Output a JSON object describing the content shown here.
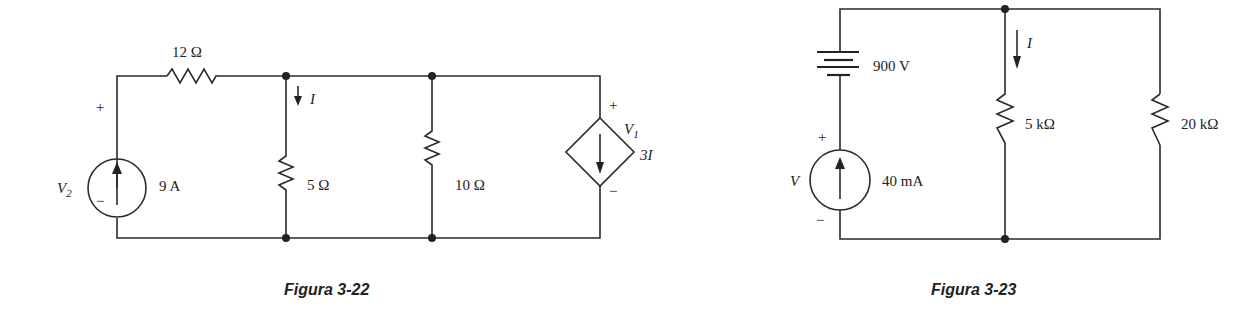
{
  "figures": [
    {
      "caption": "Figura 3-22",
      "components": {
        "r_series": {
          "label": "12 Ω"
        },
        "current_source": {
          "value": "9 A",
          "voltage_label": "V",
          "voltage_sub": "2",
          "plus": "+",
          "minus": "−"
        },
        "r_branch1": {
          "label": "5 Ω",
          "current_label": "I"
        },
        "r_branch2": {
          "label": "10 Ω"
        },
        "dependent_source": {
          "value": "3I",
          "voltage_label": "V",
          "voltage_sub": "1",
          "plus": "+",
          "minus": "−"
        }
      }
    },
    {
      "caption": "Figura 3-23",
      "components": {
        "battery": {
          "label": "900 V"
        },
        "current_source": {
          "value": "40 mA",
          "voltage_label": "V",
          "plus": "+",
          "minus": "−"
        },
        "r_branch1": {
          "label": "5 kΩ",
          "current_label": "I"
        },
        "r_branch2": {
          "label": "20 kΩ"
        }
      }
    }
  ]
}
